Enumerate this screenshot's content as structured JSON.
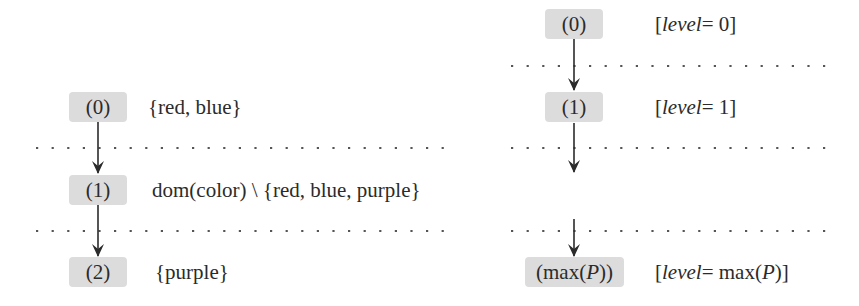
{
  "diagrams": {
    "left": {
      "nodes": [
        {
          "label": "(0)",
          "annotation": "{red, blue}"
        },
        {
          "label": "(1)",
          "annotation": "dom(color) \\ {red, blue, purple}"
        },
        {
          "label": "(2)",
          "annotation": "{purple}"
        }
      ],
      "edges": [
        {
          "from": "(0)",
          "to": "(1)"
        },
        {
          "from": "(1)",
          "to": "(2)"
        }
      ],
      "separators": 2
    },
    "right": {
      "nodes": [
        {
          "label": "(0)",
          "annotation_prefix": "[",
          "annotation_var": "level",
          "annotation_suffix": " = 0]"
        },
        {
          "label": "(1)",
          "annotation_prefix": "[",
          "annotation_var": "level",
          "annotation_suffix": " = 1]"
        },
        {
          "label_prefix": "(max(",
          "label_var": "P",
          "label_suffix": "))",
          "annotation_prefix": "[",
          "annotation_var": "level",
          "annotation_mid": " = max(",
          "annotation_var2": "P",
          "annotation_suffix": ")]"
        }
      ],
      "edges": [
        {
          "from": "(0)",
          "to": "(1)"
        },
        {
          "from": "(1)",
          "to": "...",
          "elided": true
        },
        {
          "from": "...",
          "to": "(max(P))",
          "elided": true
        }
      ],
      "separators": 3
    }
  },
  "colors": {
    "node_fill": "#dcdcdc",
    "ink": "#2b2b2b",
    "separator": "#555555"
  }
}
